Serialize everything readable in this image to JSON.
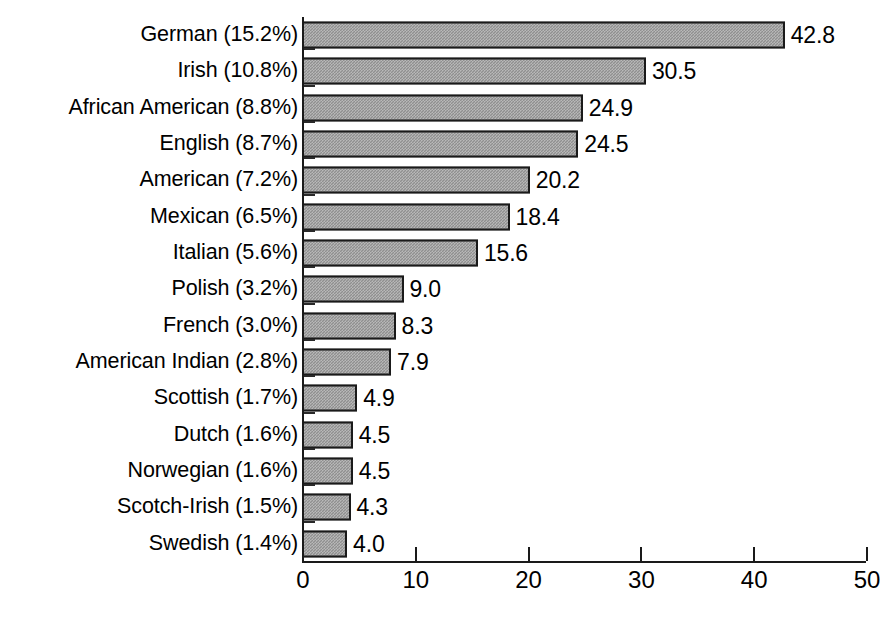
{
  "chart_data": {
    "type": "bar",
    "orientation": "horizontal",
    "title": "",
    "xlabel": "",
    "ylabel": "",
    "xlim": [
      0,
      50
    ],
    "xticks": [
      0,
      10,
      20,
      30,
      40,
      50
    ],
    "xtick_labels": [
      "0",
      "10",
      "20",
      "30",
      "40",
      "50"
    ],
    "grid": false,
    "legend": false,
    "value_labels": true,
    "categories": [
      "German (15.2%)",
      "Irish (10.8%)",
      "African American (8.8%)",
      "English (8.7%)",
      "American (7.2%)",
      "Mexican (6.5%)",
      "Italian (5.6%)",
      "Polish (3.2%)",
      "French (3.0%)",
      "American Indian (2.8%)",
      "Scottish (1.7%)",
      "Dutch (1.6%)",
      "Norwegian (1.6%)",
      "Scotch-Irish (1.5%)",
      "Swedish (1.4%)"
    ],
    "values": [
      42.8,
      30.5,
      24.9,
      24.5,
      20.2,
      18.4,
      15.6,
      9.0,
      8.3,
      7.9,
      4.9,
      4.5,
      4.5,
      4.3,
      4.0
    ],
    "value_label_text": [
      "42.8",
      "30.5",
      "24.9",
      "24.5",
      "20.2",
      "18.4",
      "15.6",
      "9.0",
      "8.3",
      "7.9",
      "4.9",
      "4.5",
      "4.5",
      "4.3",
      "4.0"
    ],
    "category_names": [
      "German",
      "Irish",
      "African American",
      "English",
      "American",
      "Mexican",
      "Italian",
      "Polish",
      "French",
      "American Indian",
      "Scottish",
      "Dutch",
      "Norwegian",
      "Scotch-Irish",
      "Swedish"
    ],
    "category_percents": [
      "15.2%",
      "10.8%",
      "8.8%",
      "8.7%",
      "7.2%",
      "6.5%",
      "5.6%",
      "3.2%",
      "3.0%",
      "2.8%",
      "1.7%",
      "1.6%",
      "1.6%",
      "1.5%",
      "1.4%"
    ],
    "colors": {
      "bar_fill": "#8f8f8f",
      "bar_border": "#1a1a1a",
      "axis": "#1a1a1a",
      "text": "#000000",
      "background": "#ffffff"
    }
  }
}
